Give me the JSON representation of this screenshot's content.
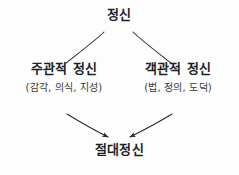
{
  "diagram": {
    "background_color": "#fdfdfd",
    "ink_color": "#2b2b2b",
    "style": "handwritten sketch",
    "nodes": {
      "spirit": {
        "label": "정신"
      },
      "subjective": {
        "label": "주관적 정신",
        "detail": "(감각, 의식, 지성)"
      },
      "objective": {
        "label": "객관적 정신",
        "detail": "(법, 정의, 도덕)"
      },
      "absolute": {
        "label": "절대정신"
      }
    },
    "edges": [
      {
        "name": "spirit-to-subjective",
        "from": "spirit",
        "to": "subjective",
        "arrowhead": false
      },
      {
        "name": "spirit-to-objective",
        "from": "spirit",
        "to": "objective",
        "arrowhead": false
      },
      {
        "name": "subjective-to-absolute",
        "from": "subjective",
        "to": "absolute",
        "arrowhead": true
      },
      {
        "name": "objective-to-absolute",
        "from": "objective",
        "to": "absolute",
        "arrowhead": true
      }
    ]
  }
}
